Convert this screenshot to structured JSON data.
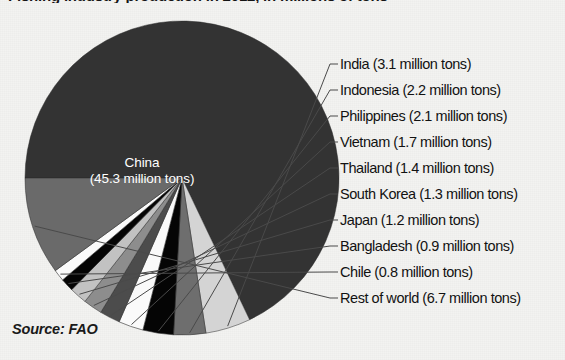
{
  "title": "Fishing industry production in 2012, in millions of tons",
  "source_note": "Source: FAO",
  "units": "million tons",
  "center_label": {
    "name": "China",
    "value_line": "(45.3 million tons)"
  },
  "colors": {
    "background": "#f3f3f1",
    "text": "#121212",
    "center_label_text": "#ffffff",
    "leader_line": "#4a4a4a",
    "wedge_china": "#333333",
    "wedge_light_gray": "#d4d4d4",
    "wedge_mid_dark_gray": "#6e6e6e",
    "wedge_black": "#050505",
    "wedge_white": "#fafafa",
    "wedge_dark_gray": "#4c4c4c",
    "wedge_mid_gray": "#8d8d8d",
    "wedge_pale_gray": "#c2c2c2",
    "wedge_rest_gray": "#6a6a6a"
  },
  "callouts": [
    {
      "label": "India (3.1 million tons)",
      "x": 340,
      "y": 57
    },
    {
      "label": "Indonesia (2.2 million tons)",
      "x": 340,
      "y": 83
    },
    {
      "label": "Philippines (2.1 million tons)",
      "x": 340,
      "y": 109
    },
    {
      "label": "Vietnam (1.7 million tons)",
      "x": 340,
      "y": 135
    },
    {
      "label": "Thailand (1.4 million tons)",
      "x": 340,
      "y": 161
    },
    {
      "label": "South Korea (1.3 million tons)",
      "x": 340,
      "y": 187
    },
    {
      "label": "Japan (1.2 million tons)",
      "x": 340,
      "y": 213
    },
    {
      "label": "Bangladesh (0.9 million tons)",
      "x": 340,
      "y": 239
    },
    {
      "label": "Chile (0.8 million tons)",
      "x": 340,
      "y": 265
    },
    {
      "label": "Rest of world (6.7 million tons)",
      "x": 340,
      "y": 291
    }
  ],
  "chart_data": {
    "type": "pie",
    "title": "Fishing industry production in 2012, in millions of tons",
    "unit": "million tons",
    "total": 66.7,
    "source": "Source: FAO",
    "legend_position": "right-callouts",
    "start_angle_deg": -90,
    "direction": "clockwise",
    "categories": [
      "China",
      "India",
      "Indonesia",
      "Philippines",
      "Vietnam",
      "Thailand",
      "South Korea",
      "Japan",
      "Bangladesh",
      "Chile",
      "Rest of world"
    ],
    "values": [
      45.3,
      3.1,
      2.2,
      2.1,
      1.7,
      1.4,
      1.3,
      1.2,
      0.9,
      0.8,
      6.7
    ],
    "slice_colors": [
      "#333333",
      "#d4d4d4",
      "#6e6e6e",
      "#050505",
      "#fafafa",
      "#4c4c4c",
      "#8d8d8d",
      "#c2c2c2",
      "#050505",
      "#fafafa",
      "#6a6a6a"
    ],
    "slices": [
      {
        "name": "China",
        "value": 45.3,
        "label": "China (45.3 million tons)",
        "color": "#333333",
        "labeled_inside": true
      },
      {
        "name": "India",
        "value": 3.1,
        "label": "India (3.1 million tons)",
        "color": "#d4d4d4",
        "labeled_inside": false
      },
      {
        "name": "Indonesia",
        "value": 2.2,
        "label": "Indonesia (2.2 million tons)",
        "color": "#6e6e6e",
        "labeled_inside": false
      },
      {
        "name": "Philippines",
        "value": 2.1,
        "label": "Philippines (2.1 million tons)",
        "color": "#050505",
        "labeled_inside": false
      },
      {
        "name": "Vietnam",
        "value": 1.7,
        "label": "Vietnam (1.7 million tons)",
        "color": "#fafafa",
        "labeled_inside": false
      },
      {
        "name": "Thailand",
        "value": 1.4,
        "label": "Thailand (1.4 million tons)",
        "color": "#4c4c4c",
        "labeled_inside": false
      },
      {
        "name": "South Korea",
        "value": 1.3,
        "label": "South Korea (1.3 million tons)",
        "color": "#8d8d8d",
        "labeled_inside": false
      },
      {
        "name": "Japan",
        "value": 1.2,
        "label": "Japan (1.2 million tons)",
        "color": "#c2c2c2",
        "labeled_inside": false
      },
      {
        "name": "Bangladesh",
        "value": 0.9,
        "label": "Bangladesh (0.9 million tons)",
        "color": "#050505",
        "labeled_inside": false
      },
      {
        "name": "Chile",
        "value": 0.8,
        "label": "Chile (0.8 million tons)",
        "color": "#fafafa",
        "labeled_inside": false
      },
      {
        "name": "Rest of world",
        "value": 6.7,
        "label": "Rest of world (6.7 million tons)",
        "color": "#6a6a6a",
        "labeled_inside": false
      }
    ]
  },
  "geometry": {
    "cx": 182,
    "cy": 178,
    "r": 157
  }
}
